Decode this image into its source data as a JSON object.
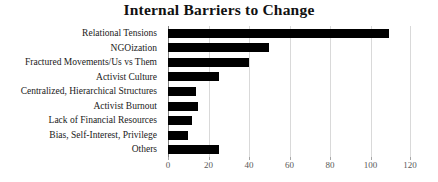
{
  "chart_data": {
    "type": "bar",
    "orientation": "horizontal",
    "title": "Internal Barriers to Change",
    "categories": [
      "Relational Tensions",
      "NGOization",
      "Fractured Movements/Us vs Them",
      "Activist Culture",
      "Centralized, Hierarchical Structures",
      "Activist Burnout",
      "Lack of Financial Resources",
      "Bias, Self-Interest, Privilege",
      "Others"
    ],
    "values": [
      109,
      50,
      40,
      25,
      14,
      15,
      12,
      10,
      25
    ],
    "xlabel": "",
    "ylabel": "",
    "xlim": [
      0,
      120
    ],
    "x_ticks": [
      0,
      20,
      40,
      60,
      80,
      100,
      120
    ],
    "grid": "vertical-gridlines-on",
    "legend": "none",
    "bar_color": "#000000",
    "gridline_color": "#d9d9d9",
    "axis_line_color": "#808080",
    "tick_mark_color": "#a6a6a6",
    "tick_label_color": "#595959",
    "background_color": "#ffffff"
  }
}
